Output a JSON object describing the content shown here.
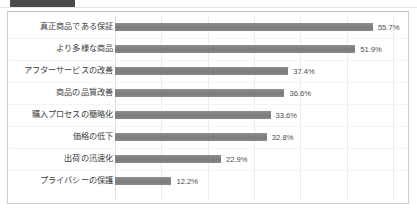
{
  "window": {
    "tab_label": "",
    "ghost_text": ""
  },
  "chart_data": {
    "type": "bar",
    "orientation": "horizontal",
    "title": "",
    "subtitle": "",
    "xlabel": "",
    "ylabel": "",
    "xlim": [
      0,
      60
    ],
    "grid": true,
    "gridlines": [
      0,
      10,
      20,
      30,
      40,
      50,
      60
    ],
    "legend": null,
    "value_suffix": "%",
    "categories": [
      "真正商品である保証",
      "より多様な商品",
      "アフターサービスの改善",
      "商品の品質改善",
      "購入プロセスの簡略化",
      "価格の低下",
      "出荷の迅速化",
      "プライバシーの保護"
    ],
    "values": [
      55.7,
      51.9,
      37.4,
      36.6,
      33.6,
      32.8,
      22.9,
      12.2
    ],
    "value_labels": [
      "55.7%",
      "51.9%",
      "37.4%",
      "36.6%",
      "33.6%",
      "32.8%",
      "22.9%",
      "12.2%"
    ],
    "bar_color": "#808080",
    "grid_color": "#ececec",
    "text_color": "#3d3d3d"
  }
}
